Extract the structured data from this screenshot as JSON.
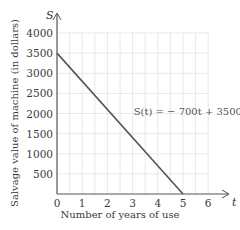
{
  "chart_data": {
    "type": "line",
    "title": "",
    "xlabel": "Number of years of use",
    "ylabel": "Salvage value of machine (in dollars)",
    "x_axis_symbol": "t",
    "y_axis_symbol": "S",
    "xlim": [
      0,
      6
    ],
    "ylim": [
      0,
      4000
    ],
    "x_ticks": [
      "0",
      "1",
      "2",
      "3",
      "4",
      "5",
      "6"
    ],
    "y_ticks": [
      "500",
      "1000",
      "1500",
      "2000",
      "2500",
      "3000",
      "3500",
      "4000"
    ],
    "grid": true,
    "series": [
      {
        "name": "S(t) = − 700t + 3500",
        "x": [
          0,
          5
        ],
        "y": [
          3500,
          0
        ],
        "color": "#555555"
      }
    ],
    "annotations": [
      {
        "text": "S(t) = − 700t + 3500",
        "x": 3.4,
        "y": 2050
      }
    ]
  }
}
